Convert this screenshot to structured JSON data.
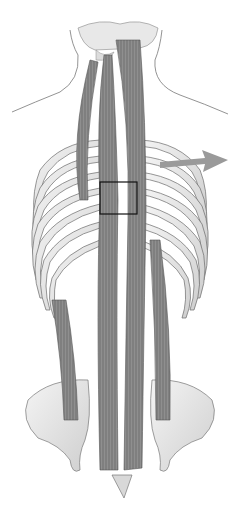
{
  "figure": {
    "subject": "Posterior view of deep back muscles (erector spinae / transversospinalis) over spine, rib cage and pelvis",
    "style": "grayscale anatomical illustration",
    "background": "#ffffff",
    "muscle_color": "#8a8a8a",
    "bone_color": "#e6e6e6",
    "outline_color": "#555555",
    "highlight_box": {
      "x": 100,
      "y": 182,
      "w": 37,
      "h": 32,
      "stroke": "#111111"
    },
    "arrow": {
      "color": "#9a9a9a",
      "direction": "right"
    }
  }
}
